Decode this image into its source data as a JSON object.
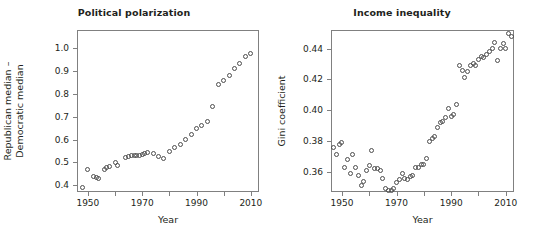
{
  "figure": {
    "background": "#ffffff",
    "frame_color": "#808080",
    "marker_color": "#4d4d4d",
    "text_color": "#231f20"
  },
  "panels": [
    {
      "id": "political-polarization",
      "title": "Political polarization",
      "xlabel": "Year",
      "ylabel_lines": [
        "Republican median –",
        "Democratic median"
      ],
      "xticks": [
        "1950",
        "1970",
        "1990",
        "2010"
      ],
      "yticks": [
        "0.4",
        "0.5",
        "0.6",
        "0.7",
        "0.8",
        "0.9",
        "1.0"
      ]
    },
    {
      "id": "income-inequality",
      "title": "Income inequality",
      "xlabel": "Year",
      "ylabel_lines": [
        "Gini coefficient"
      ],
      "xticks": [
        "1950",
        "1970",
        "1990",
        "2010"
      ],
      "yticks": [
        "0.36",
        "0.38",
        "0.40",
        "0.42",
        "0.44"
      ]
    }
  ],
  "chart_data": [
    {
      "type": "scatter",
      "title": "Political polarization",
      "xlabel": "Year",
      "ylabel": "Republican median – Democratic median",
      "xlim": [
        1946,
        2013
      ],
      "ylim": [
        0.37,
        1.08
      ],
      "xticks": [
        1950,
        1970,
        1990,
        2010
      ],
      "yticks": [
        0.4,
        0.5,
        0.6,
        0.7,
        0.8,
        0.9,
        1.0
      ],
      "grid": false,
      "legend": null,
      "x": [
        1948,
        1950,
        1952,
        1953,
        1954,
        1956,
        1957,
        1958,
        1960,
        1961,
        1964,
        1965,
        1966,
        1967,
        1968,
        1969,
        1970,
        1971,
        1972,
        1974,
        1976,
        1978,
        1980,
        1982,
        1984,
        1986,
        1988,
        1990,
        1992,
        1994,
        1996,
        1998,
        2000,
        2002,
        2004,
        2006,
        2008,
        2010
      ],
      "y": [
        0.391,
        0.468,
        0.438,
        0.432,
        0.43,
        0.47,
        0.476,
        0.483,
        0.5,
        0.488,
        0.521,
        0.524,
        0.528,
        0.53,
        0.531,
        0.531,
        0.535,
        0.54,
        0.543,
        0.539,
        0.525,
        0.516,
        0.546,
        0.563,
        0.58,
        0.599,
        0.62,
        0.65,
        0.663,
        0.681,
        0.743,
        0.843,
        0.857,
        0.881,
        0.912,
        0.931,
        0.962,
        0.976
      ]
    },
    {
      "type": "scatter",
      "title": "Income inequality",
      "xlabel": "Year",
      "ylabel": "Gini coefficient",
      "xlim": [
        1946,
        2013
      ],
      "ylim": [
        0.347,
        0.452
      ],
      "xticks": [
        1950,
        1970,
        1990,
        2010
      ],
      "yticks": [
        0.36,
        0.38,
        0.4,
        0.42,
        0.44
      ],
      "grid": false,
      "legend": null,
      "x": [
        1947,
        1948,
        1949,
        1950,
        1951,
        1952,
        1953,
        1954,
        1955,
        1956,
        1957,
        1958,
        1959,
        1960,
        1961,
        1962,
        1963,
        1964,
        1965,
        1966,
        1967,
        1968,
        1969,
        1970,
        1971,
        1972,
        1973,
        1974,
        1975,
        1976,
        1977,
        1978,
        1979,
        1980,
        1981,
        1982,
        1983,
        1984,
        1985,
        1986,
        1987,
        1988,
        1989,
        1990,
        1991,
        1992,
        1993,
        1994,
        1995,
        1996,
        1997,
        1998,
        1999,
        2000,
        2001,
        2002,
        2003,
        2004,
        2005,
        2006,
        2007,
        2008,
        2009,
        2010,
        2011,
        2012
      ],
      "y": [
        0.376,
        0.371,
        0.378,
        0.379,
        0.363,
        0.368,
        0.359,
        0.371,
        0.363,
        0.358,
        0.351,
        0.354,
        0.361,
        0.364,
        0.374,
        0.362,
        0.362,
        0.361,
        0.356,
        0.349,
        0.348,
        0.348,
        0.349,
        0.353,
        0.355,
        0.359,
        0.356,
        0.355,
        0.357,
        0.358,
        0.363,
        0.363,
        0.365,
        0.365,
        0.369,
        0.38,
        0.382,
        0.383,
        0.389,
        0.392,
        0.393,
        0.395,
        0.401,
        0.396,
        0.397,
        0.404,
        0.429,
        0.426,
        0.421,
        0.425,
        0.429,
        0.43,
        0.429,
        0.433,
        0.435,
        0.434,
        0.436,
        0.438,
        0.44,
        0.444,
        0.432,
        0.44,
        0.443,
        0.44,
        0.45,
        0.448
      ]
    }
  ]
}
